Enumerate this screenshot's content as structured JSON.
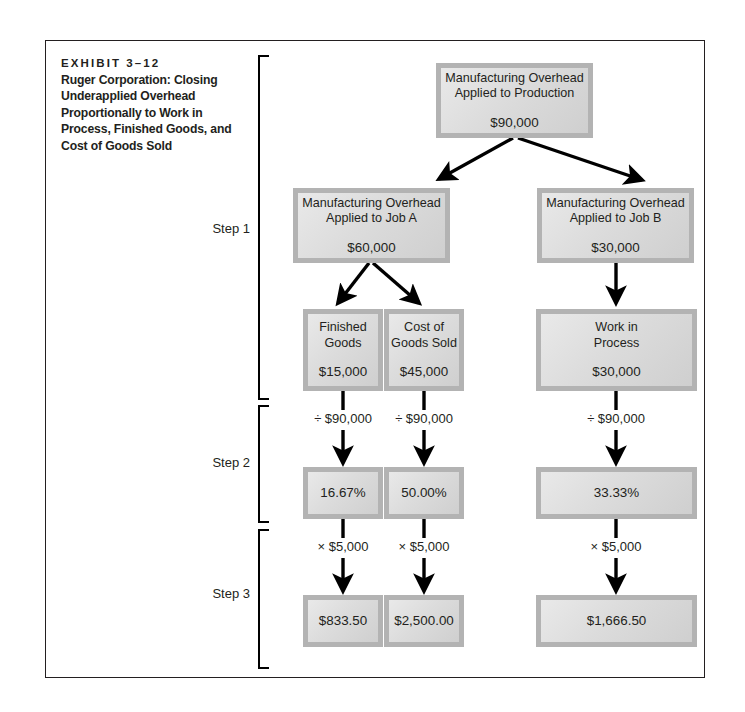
{
  "exhibit": {
    "label": "EXHIBIT 3–12",
    "caption": "Ruger Corporation: Closing Underapplied Overhead Proportionally to Work in Process, Finished Goods, and Cost of Goods Sold"
  },
  "steps": [
    {
      "label": "Step 1"
    },
    {
      "label": "Step 2"
    },
    {
      "label": "Step 3"
    }
  ],
  "nodes": {
    "overhead_applied": {
      "title": "Manufacturing Overhead\nApplied to Production",
      "amount": "$90,000"
    },
    "job_a": {
      "title": "Manufacturing Overhead\nApplied to Job A",
      "amount": "$60,000"
    },
    "job_b": {
      "title": "Manufacturing Overhead\nApplied to Job B",
      "amount": "$30,000"
    },
    "finished_goods": {
      "title": "Finished\nGoods",
      "amount": "$15,000"
    },
    "cost_of_goods_sold": {
      "title": "Cost of\nGoods Sold",
      "amount": "$45,000"
    },
    "work_in_process": {
      "title": "Work in\nProcess",
      "amount": "$30,000"
    },
    "pct_finished_goods": {
      "amount": "16.67%"
    },
    "pct_cost_of_goods_sold": {
      "amount": "50.00%"
    },
    "pct_work_in_process": {
      "amount": "33.33%"
    },
    "alloc_finished_goods": {
      "amount": "$833.50"
    },
    "alloc_cost_of_goods_sold": {
      "amount": "$2,500.00"
    },
    "alloc_work_in_process": {
      "amount": "$1,666.50"
    }
  },
  "operators": {
    "divide_fg": "÷ $90,000",
    "divide_cogs": "÷ $90,000",
    "divide_wip": "÷ $90,000",
    "multiply_fg": "× $5,000",
    "multiply_cogs": "× $5,000",
    "multiply_wip": "× $5,000"
  },
  "colors": {
    "frame": "#231f20",
    "box_border": "#b3b3b3",
    "box_fill_light": "#e9e9e9",
    "box_fill_dark": "#cfcfcf",
    "arrow": "#000000",
    "text": "#231f20"
  }
}
